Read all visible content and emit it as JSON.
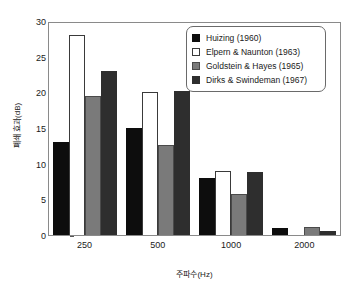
{
  "chart_data": {
    "type": "bar",
    "title": "",
    "xlabel": "주파수(Hz)",
    "ylabel": "폐쇄 효과(dB)",
    "categories": [
      "250",
      "500",
      "1000",
      "2000"
    ],
    "ylim": [
      0,
      30
    ],
    "yticks": [
      "0",
      "5",
      "10",
      "15",
      "20",
      "25",
      "30"
    ],
    "grid": false,
    "legend_position": "top-right",
    "series": [
      {
        "name": "Huizing (1960)",
        "color": "#0d0d0d",
        "values": [
          13,
          15,
          8,
          1
        ]
      },
      {
        "name": "Elpern & Naunton (1963)",
        "color": "#ffffff",
        "values": [
          28,
          20,
          9,
          0
        ]
      },
      {
        "name": "Goldstein & Hayes (1965)",
        "color": "#7a7a7a",
        "values": [
          19.5,
          12.6,
          5.7,
          1.1
        ]
      },
      {
        "name": "Dirks & Swindeman (1967)",
        "color": "#2e2e2e",
        "values": [
          23,
          20.2,
          8.9,
          0.5
        ]
      }
    ]
  }
}
